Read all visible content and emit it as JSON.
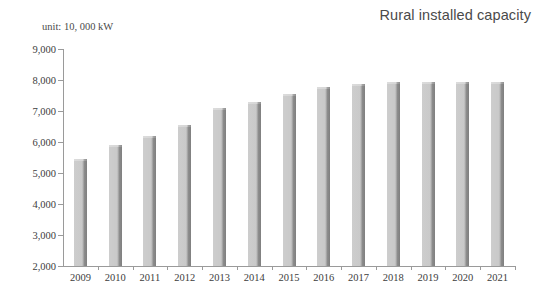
{
  "chart_data": {
    "type": "bar",
    "title": "Rural installed capacity",
    "subtitle": "",
    "unit_note": "unit: 10, 000 kW",
    "xlabel": "",
    "ylabel": "",
    "ylim": [
      2000,
      9000
    ],
    "y_ticks": [
      "2,000",
      "3,000",
      "4,000",
      "5,000",
      "6,000",
      "7,000",
      "8,000",
      "9,000"
    ],
    "y_tick_values": [
      2000,
      3000,
      4000,
      5000,
      6000,
      7000,
      8000,
      9000
    ],
    "grid": false,
    "legend": null,
    "categories": [
      "2009",
      "2010",
      "2011",
      "2012",
      "2013",
      "2014",
      "2015",
      "2016",
      "2017",
      "2018",
      "2019",
      "2020",
      "2021"
    ],
    "values": [
      5450,
      5900,
      6180,
      6560,
      7110,
      7290,
      7560,
      7760,
      7880,
      7930,
      7930,
      7930,
      7930
    ],
    "series": [
      {
        "name": "Rural installed capacity",
        "values": [
          5450,
          5900,
          6180,
          6560,
          7110,
          7290,
          7560,
          7760,
          7880,
          7930,
          7930,
          7930,
          7930
        ]
      }
    ],
    "colors": {
      "bar_face": "#c9c9c9",
      "bar_shadow": "#8c8c8c",
      "axis": "#9a9a9a",
      "text": "#3d3d3d",
      "title_text": "#4a4a4a",
      "background": "#ffffff"
    }
  }
}
